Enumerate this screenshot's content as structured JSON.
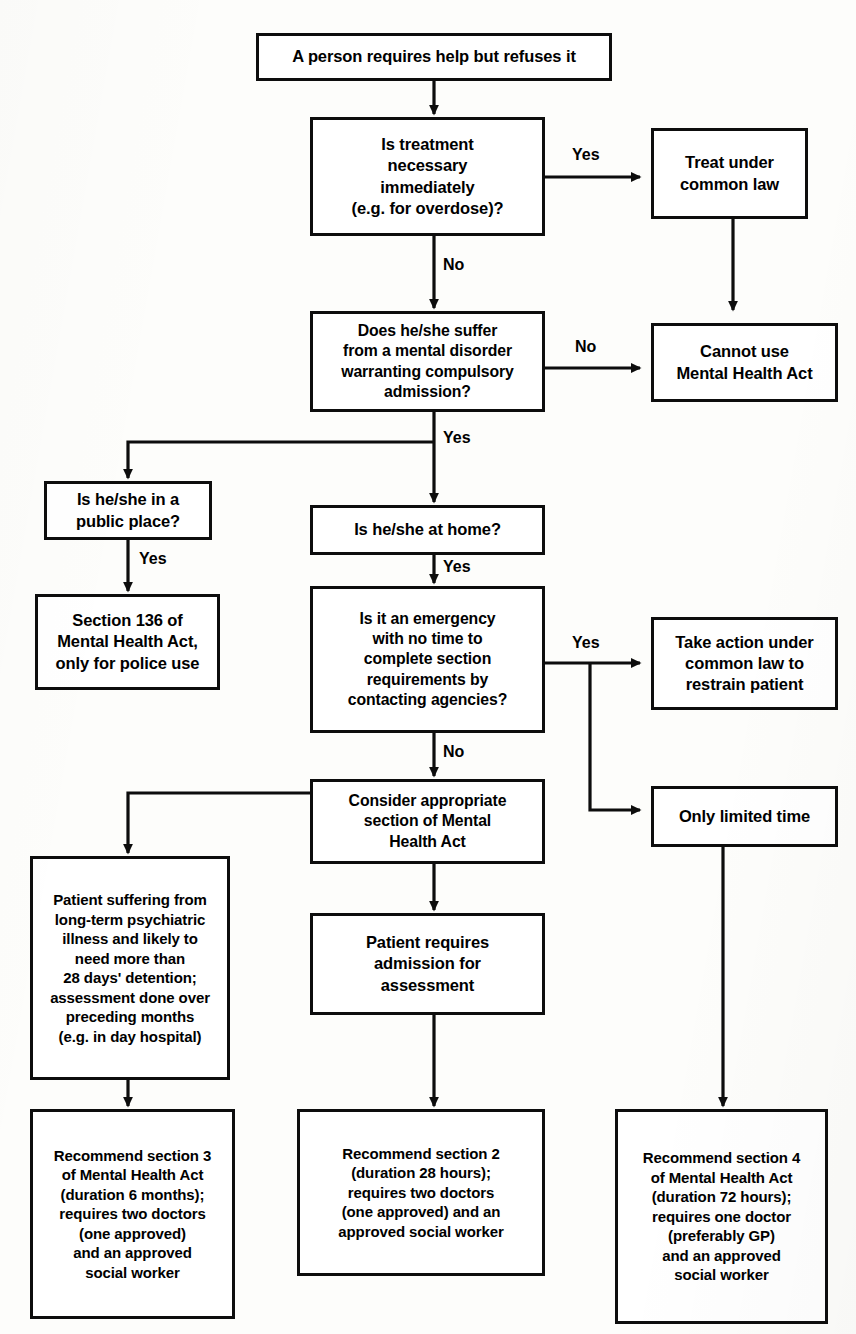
{
  "diagram": {
    "line_color": "#0d0d0d",
    "background_color": "#fdfdfb",
    "nodes": {
      "start": "A person requires help but refuses it",
      "treatment_necessary": "Is treatment\nnecessary\nimmediately\n(e.g. for overdose)?",
      "treat_common_law": "Treat under\ncommon law",
      "mental_disorder": "Does he/she suffer\nfrom a mental disorder\nwarranting compulsory\nadmission?",
      "cannot_use_mha": "Cannot use\nMental Health Act",
      "public_place": "Is he/she in a\npublic place?",
      "section_136": "Section 136 of\nMental Health Act,\nonly for police use",
      "at_home": "Is he/she at home?",
      "emergency": "Is it an emergency\nwith no time to\ncomplete section\nrequirements by\ncontacting agencies?",
      "take_action_common_law": "Take action under\ncommon law to\nrestrain patient",
      "only_limited_time": "Only limited time",
      "consider_section": "Consider appropriate\nsection of Mental\nHealth Act",
      "long_term": "Patient suffering from\nlong-term psychiatric\nillness and likely to\nneed more than\n28 days' detention;\nassessment done over\npreceding months\n(e.g. in day hospital)",
      "requires_admission": "Patient requires\nadmission for\nassessment",
      "recommend_s3": "Recommend section 3\nof Mental Health Act\n(duration 6 months);\nrequires two doctors\n(one approved)\nand an approved\nsocial worker",
      "recommend_s2": "Recommend section 2\n(duration 28 hours);\nrequires two doctors\n(one approved) and an\napproved social worker",
      "recommend_s4": "Recommend section 4\nof Mental Health Act\n(duration 72 hours);\nrequires one doctor\n(preferably GP)\nand an approved\nsocial worker"
    },
    "edge_labels": {
      "treatment_yes": "Yes",
      "treatment_no": "No",
      "disorder_no": "No",
      "disorder_yes": "Yes",
      "public_place_yes": "Yes",
      "at_home_yes": "Yes",
      "emergency_yes": "Yes",
      "emergency_no": "No"
    }
  }
}
